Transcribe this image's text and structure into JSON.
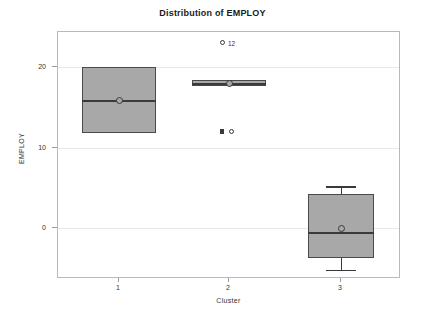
{
  "chart_data": {
    "type": "box",
    "title": "Distribution of EMPLOY",
    "xlabel": "Cluster",
    "ylabel": "EMPLOY",
    "grid": true,
    "legend": "none",
    "categories": [
      "1",
      "2",
      "3"
    ],
    "ytick_labels": [
      "20",
      "10",
      "0"
    ],
    "ytick_values": [
      20,
      10,
      0
    ],
    "ylim": [
      -6.5,
      24.0
    ],
    "boxes": [
      {
        "category": "1",
        "q1": 11.8,
        "median": 15.9,
        "q3": 20.0,
        "mean": 15.9,
        "whisker_low": null,
        "whisker_high": null,
        "outliers": []
      },
      {
        "category": "2",
        "q1": 17.6,
        "median": 18.0,
        "q3": 18.4,
        "mean": 18.0,
        "whisker_low": null,
        "whisker_high": null,
        "outliers": [
          {
            "value": 23.0,
            "style": "open",
            "label": "12"
          },
          {
            "value": 12.0,
            "style": "filled",
            "label": ""
          },
          {
            "value": 12.0,
            "style": "open",
            "label": ""
          }
        ]
      },
      {
        "category": "3",
        "q1": -3.7,
        "median": -0.5,
        "q3": 4.2,
        "mean": 0.0,
        "whisker_low": -5.2,
        "whisker_high": 5.2,
        "outliers": []
      }
    ],
    "colors": {
      "box_fill": "#a8a8a8",
      "box_border": "#4a4a4a",
      "grid": "#e8e8e8",
      "frame": "#b9b9b9",
      "text": "#333333",
      "title_text": "#1a1a1a",
      "background": "#ffffff"
    }
  }
}
